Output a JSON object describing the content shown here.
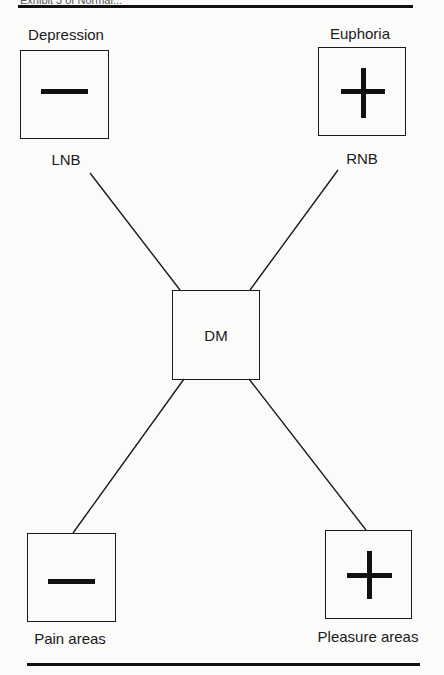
{
  "header": {
    "partial_caption": "Exhibit 3 of Normal..."
  },
  "nodes": {
    "depression": {
      "title": "Depression",
      "sign": "minus",
      "sublabel": "LNB"
    },
    "euphoria": {
      "title": "Euphoria",
      "sign": "plus",
      "sublabel": "RNB"
    },
    "center": {
      "label": "DM"
    },
    "pain": {
      "label": "Pain areas",
      "sign": "minus"
    },
    "pleasure": {
      "label": "Pleasure areas",
      "sign": "plus"
    }
  },
  "edges": [
    {
      "from": "LNB",
      "to": "DM"
    },
    {
      "from": "RNB",
      "to": "DM"
    },
    {
      "from": "DM",
      "to": "Pain areas"
    },
    {
      "from": "DM",
      "to": "Pleasure areas"
    }
  ],
  "colors": {
    "ink": "#111111",
    "paper": "#fbfbfa"
  }
}
